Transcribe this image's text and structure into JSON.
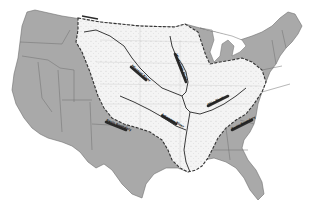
{
  "map": {
    "subject": "Mississippi River Basin, contiguous United States",
    "colors": {
      "states_fill": "#a9a9a9",
      "state_borders": "#6f6f6f",
      "basin_fill": "#f4f4f4",
      "basin_dots": "#9a9a9a",
      "basin_boundary": "#333333",
      "rivers": "#3a3a3a",
      "background": "#ffffff"
    },
    "rivers": [
      {
        "id": "missouri",
        "label": "Missouri River"
      },
      {
        "id": "upper-mississippi",
        "label": "Mississippi River"
      },
      {
        "id": "ohio",
        "label": "Ohio River"
      },
      {
        "id": "arkansas",
        "label": "Arkansas River"
      }
    ],
    "boundaries": [
      {
        "id": "western",
        "label": "Basin Boundary"
      },
      {
        "id": "southwestern",
        "label": "Basin Boundary"
      },
      {
        "id": "southeastern",
        "label": "Basin Boundary"
      }
    ]
  }
}
